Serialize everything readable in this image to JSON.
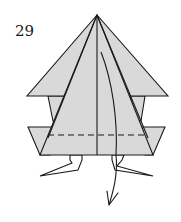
{
  "step": {
    "number": "29"
  },
  "diagram": {
    "fill_color": "#d9d9d9",
    "line_color": "#1a1a1a",
    "fold_line_style": "dashed valley fold",
    "arrow": "fold down / unfold arrow",
    "parts": [
      "top-layer-triangle",
      "rear-wings",
      "lower-side-flaps",
      "center-crease",
      "valley-fold-line",
      "left-leg",
      "right-leg",
      "fold-arrow"
    ]
  }
}
